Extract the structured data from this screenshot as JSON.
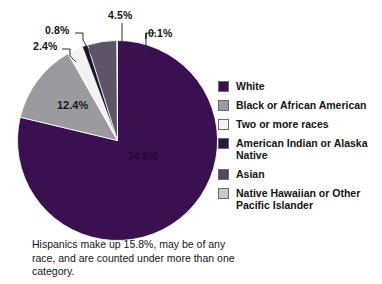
{
  "chart_data": {
    "type": "pie",
    "title": "",
    "subtitle": "",
    "xlabel": "",
    "ylabel": "",
    "unit": "percent",
    "legend_position": "right",
    "grid": false,
    "start_angle_deg": 0,
    "direction": "clockwise",
    "categories": [
      "White",
      "Black or African American",
      "Two or more races",
      "American Indian or Alaska Native",
      "Asian",
      "Native Hawaiian or Other Pacific Islander"
    ],
    "values": [
      74.8,
      12.4,
      2.4,
      0.8,
      4.5,
      0.1
    ],
    "labels": [
      "74.8%",
      "12.4%",
      "2.4%",
      "0.8%",
      "4.5%",
      "0.1%"
    ],
    "colors": [
      "#3b1050",
      "#9b9b9f",
      "#f2f2f0",
      "#1d1230",
      "#5d5468",
      "#c9c9c9"
    ],
    "slices": [
      {
        "name": "White",
        "value": 74.8,
        "label": "74.8%",
        "color": "#3b1050",
        "label_placement": "inside"
      },
      {
        "name": "Black or African American",
        "value": 12.4,
        "label": "12.4%",
        "color": "#9b9b9f",
        "label_placement": "inside"
      },
      {
        "name": "Two or more races",
        "value": 2.4,
        "label": "2.4%",
        "color": "#f2f2f0",
        "label_placement": "callout"
      },
      {
        "name": "American Indian or Alaska Native",
        "value": 0.8,
        "label": "0.8%",
        "color": "#1d1230",
        "label_placement": "callout"
      },
      {
        "name": "Asian",
        "value": 4.5,
        "label": "4.5%",
        "color": "#5d5468",
        "label_placement": "callout"
      },
      {
        "name": "Native Hawaiian or Other Pacific Islander",
        "value": 0.1,
        "label": "0.1%",
        "color": "#c9c9c9",
        "label_placement": "callout"
      }
    ],
    "annotations": [
      "Hispanics make up 15.8%, may be of any race, and are counted under more than one category."
    ]
  },
  "callouts": {
    "two_or_more": "2.4%",
    "american_indian": "0.8%",
    "asian": "4.5%",
    "native_hawaiian": "0.1%"
  },
  "inside_labels": {
    "black": "12.4%",
    "white": "74.8%"
  },
  "legend": {
    "items": [
      {
        "label": "White",
        "color": "#3b1050"
      },
      {
        "label": "Black or African American",
        "color": "#9b9b9f"
      },
      {
        "label": "Two or more races",
        "color": "#f2f2f0"
      },
      {
        "label": "American Indian or Alaska Native",
        "color": "#2a1640"
      },
      {
        "label": "Asian",
        "color": "#54495f"
      },
      {
        "label": "Native Hawaiian or Other Pacific Islander",
        "color": "#c9c9c9"
      }
    ]
  },
  "caption": {
    "text": "Hispanics make up 15.8%, may be of any race, and are counted under more than one category."
  }
}
